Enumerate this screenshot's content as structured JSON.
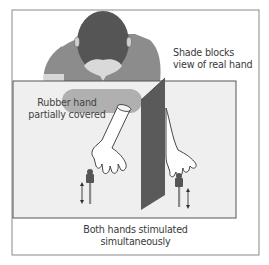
{
  "figure": {
    "labels": {
      "shade": {
        "line1": "Shade blocks",
        "line2": "view of real hand"
      },
      "rubber": {
        "line1": "Rubber hand",
        "line2": "partially covered"
      },
      "both": {
        "line1": "Both hands stimulated",
        "line2": "simultaneously"
      }
    },
    "colors": {
      "frame": "#8a8a8a",
      "table": "#efefef",
      "table_border": "#555555",
      "shirt": "#8c8c8c",
      "head": "#555555",
      "face": "#d9d9d9",
      "shade_panel": "#5a5a5a",
      "cover_cloth": "#a8a8a8",
      "brush": "#555555",
      "brush_handle": "#8a8a8a",
      "hand_outline": "#333333",
      "hand_fill": "#ffffff"
    }
  }
}
